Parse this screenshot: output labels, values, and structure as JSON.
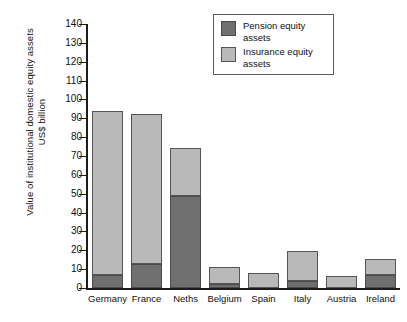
{
  "chart_data": {
    "type": "bar",
    "subtype": "stacked-bar",
    "title": "",
    "xlabel": "",
    "ylabel": "Value of institutional domestic equity assets US$ billion",
    "ylabel_lines": [
      "Value of institutional domestic equity assets",
      "US$ billion"
    ],
    "ylim": [
      0,
      140
    ],
    "ytick_step": 10,
    "yticks": [
      140,
      130,
      120,
      110,
      100,
      90,
      80,
      70,
      60,
      50,
      40,
      30,
      20,
      10,
      0
    ],
    "ytick_labels": [
      "140",
      "130",
      "120",
      "110",
      "100",
      "90",
      "80",
      "70",
      "60",
      "50",
      "40",
      "30",
      "20",
      "10",
      "0"
    ],
    "grid": false,
    "legend_position": "top-right",
    "categories": [
      "Germany",
      "France",
      "Neths",
      "Belgium",
      "Spain",
      "Italy",
      "Austria",
      "Ireland"
    ],
    "series": [
      {
        "name": "Pension equity assets",
        "color": "#6f6f6f",
        "values": [
          7,
          13,
          49,
          2,
          0,
          3.5,
          0,
          7
        ]
      },
      {
        "name": "Insurance equity assets",
        "color": "#b9b9b9",
        "values": [
          87,
          79.5,
          25,
          9,
          8,
          16,
          6.5,
          8.5
        ]
      }
    ],
    "totals": [
      94,
      92.5,
      74,
      11,
      8,
      19.5,
      6.5,
      15.5
    ]
  },
  "legend": {
    "entries": [
      {
        "label_line1": "Pension equity",
        "label_line2": "assets",
        "swatch": "pension-swatch"
      },
      {
        "label_line1": "Insurance equity",
        "label_line2": "assets",
        "swatch": "insurance-swatch"
      }
    ]
  },
  "colors": {
    "pension": "#6f6f6f",
    "insurance": "#b9b9b9",
    "axis": "#1c1c1c",
    "background": "#ffffff"
  }
}
